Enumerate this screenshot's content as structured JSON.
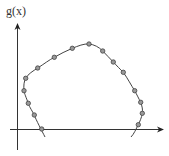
{
  "diagram": {
    "y_axis_label": "g(x)",
    "curve": "closed-loop-like curve crossing x-axis twice",
    "colors": {
      "axis": "#333333",
      "curve": "#444444",
      "marker_fill": "#999999",
      "marker_stroke": "#444444"
    },
    "points": [
      [
        41.7,
        129
      ],
      [
        34.3,
        115
      ],
      [
        28.3,
        103.3
      ],
      [
        24,
        90.7
      ],
      [
        25.7,
        78.3
      ],
      [
        37.7,
        68
      ],
      [
        54.3,
        57.3
      ],
      [
        72.3,
        48.3
      ],
      [
        89,
        44
      ],
      [
        102.7,
        51
      ],
      [
        113.3,
        62
      ],
      [
        123.3,
        72.3
      ],
      [
        134.7,
        90.7
      ],
      [
        140.7,
        102.3
      ],
      [
        142.3,
        113.3
      ],
      [
        138.3,
        124.7
      ]
    ]
  }
}
